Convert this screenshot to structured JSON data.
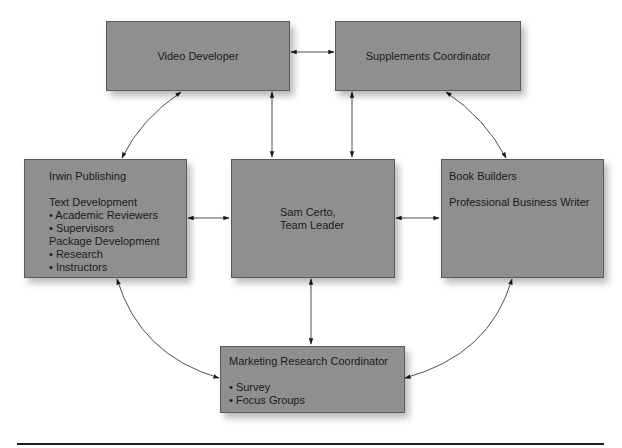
{
  "diagram": {
    "type": "organization-team-diagram",
    "nodes": {
      "video_developer": {
        "title": "Video Developer"
      },
      "supplements_coordinator": {
        "title": "Supplements Coordinator"
      },
      "irwin_publishing": {
        "title": "Irwin Publishing",
        "lines": [
          "Text Development",
          "• Academic Reviewers",
          "• Supervisors",
          "Package Development",
          "• Research",
          "• Instructors"
        ]
      },
      "team_leader": {
        "lines": [
          "Sam Certo,",
          "Team Leader"
        ]
      },
      "book_builders": {
        "title": "Book Builders",
        "subtitle": "Professional Business Writer"
      },
      "marketing_research": {
        "title": "Marketing Research Coordinator",
        "lines": [
          "• Survey",
          "• Focus Groups"
        ]
      }
    },
    "edges": [
      {
        "from": "Video Developer",
        "to": "Supplements Coordinator",
        "style": "straight",
        "arrows": "both"
      },
      {
        "from": "Video Developer",
        "to": "Sam Certo, Team Leader",
        "style": "straight",
        "arrows": "both"
      },
      {
        "from": "Supplements Coordinator",
        "to": "Sam Certo, Team Leader",
        "style": "straight",
        "arrows": "both"
      },
      {
        "from": "Irwin Publishing",
        "to": "Sam Certo, Team Leader",
        "style": "straight",
        "arrows": "both"
      },
      {
        "from": "Book Builders",
        "to": "Sam Certo, Team Leader",
        "style": "straight",
        "arrows": "both"
      },
      {
        "from": "Sam Certo, Team Leader",
        "to": "Marketing Research Coordinator",
        "style": "straight",
        "arrows": "both"
      },
      {
        "from": "Video Developer",
        "to": "Irwin Publishing",
        "style": "curved",
        "arrows": "both"
      },
      {
        "from": "Supplements Coordinator",
        "to": "Book Builders",
        "style": "curved",
        "arrows": "both"
      },
      {
        "from": "Irwin Publishing",
        "to": "Marketing Research Coordinator",
        "style": "curved",
        "arrows": "both"
      },
      {
        "from": "Book Builders",
        "to": "Marketing Research Coordinator",
        "style": "curved",
        "arrows": "both"
      }
    ],
    "colors": {
      "box_fill": "#8f8f8f",
      "box_border": "#5a5a5a",
      "line": "#2a2a2a",
      "text": "#1a1a1a"
    }
  }
}
